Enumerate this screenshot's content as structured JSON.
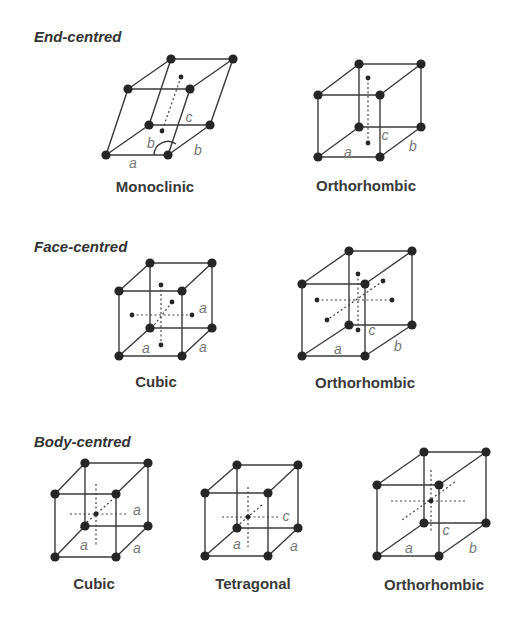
{
  "sections": [
    {
      "label": "End-centred",
      "x": 34,
      "y": 42
    },
    {
      "label": "Face-centred",
      "x": 34,
      "y": 252
    },
    {
      "label": "Body-centred",
      "x": 34,
      "y": 447
    }
  ],
  "lattices": [
    {
      "id": "end-monoclinic",
      "name": "Monoclinic",
      "title_x": 155,
      "title_y": 192,
      "v": {
        "btl": [
          171,
          59
        ],
        "btr": [
          233,
          59
        ],
        "ftl": [
          128,
          89
        ],
        "ftr": [
          190,
          89
        ],
        "bbl": [
          149,
          125
        ],
        "bbr": [
          210,
          125
        ],
        "fbl": [
          106,
          155
        ],
        "fbr": [
          168,
          155
        ]
      },
      "dots": [
        [
          181,
          77
        ],
        [
          162,
          131
        ]
      ],
      "dashes": [
        [
          [
            181,
            77
          ],
          [
            162,
            131
          ]
        ]
      ],
      "labels": [
        {
          "t": "c",
          "x": 189,
          "y": 122
        },
        {
          "t": "b",
          "x": 151,
          "y": 148
        },
        {
          "t": "b",
          "x": 198,
          "y": 155
        },
        {
          "t": "a",
          "x": 133,
          "y": 168
        }
      ],
      "arc": true
    },
    {
      "id": "end-orthorhombic",
      "name": "Orthorhombic",
      "title_x": 366,
      "title_y": 191,
      "v": {
        "btl": [
          359,
          64
        ],
        "btr": [
          421,
          64
        ],
        "ftl": [
          318,
          95
        ],
        "ftr": [
          380,
          95
        ],
        "bbl": [
          359,
          127
        ],
        "bbr": [
          421,
          127
        ],
        "fbl": [
          318,
          157
        ],
        "fbr": [
          380,
          157
        ]
      },
      "dots": [
        [
          368,
          78
        ],
        [
          368,
          143
        ]
      ],
      "dashes": [
        [
          [
            368,
            78
          ],
          [
            368,
            143
          ]
        ]
      ],
      "labels": [
        {
          "t": "c",
          "x": 385,
          "y": 140
        },
        {
          "t": "a",
          "x": 348,
          "y": 157
        },
        {
          "t": "b",
          "x": 413,
          "y": 151
        }
      ]
    },
    {
      "id": "face-cubic",
      "name": "Cubic",
      "title_x": 156,
      "title_y": 387,
      "v": {
        "btl": [
          150,
          263
        ],
        "btr": [
          212,
          263
        ],
        "ftl": [
          119,
          291
        ],
        "ftr": [
          182,
          291
        ],
        "bbl": [
          150,
          328
        ],
        "bbr": [
          212,
          328
        ],
        "fbl": [
          119,
          356
        ],
        "fbr": [
          182,
          356
        ]
      },
      "dots": [
        [
          161,
          285
        ],
        [
          172,
          302
        ],
        [
          132,
          315
        ],
        [
          192,
          315
        ],
        [
          161,
          345
        ]
      ],
      "dashes": [
        [
          [
            161,
            285
          ],
          [
            161,
            345
          ]
        ],
        [
          [
            132,
            315
          ],
          [
            192,
            315
          ]
        ],
        [
          [
            172,
            302
          ],
          [
            152,
            328
          ]
        ]
      ],
      "labels": [
        {
          "t": "a",
          "x": 203,
          "y": 313
        },
        {
          "t": "a",
          "x": 146,
          "y": 353
        },
        {
          "t": "a",
          "x": 203,
          "y": 352
        }
      ]
    },
    {
      "id": "face-orthorhombic",
      "name": "Orthorhombic",
      "title_x": 365,
      "title_y": 388,
      "v": {
        "btl": [
          349,
          251
        ],
        "btr": [
          412,
          251
        ],
        "ftl": [
          302,
          284
        ],
        "ftr": [
          365,
          284
        ],
        "bbl": [
          349,
          325
        ],
        "bbr": [
          412,
          325
        ],
        "fbl": [
          302,
          356
        ],
        "fbr": [
          365,
          356
        ]
      },
      "dots": [
        [
          358,
          274
        ],
        [
          383,
          281
        ],
        [
          317,
          300
        ],
        [
          392,
          300
        ],
        [
          327,
          320
        ],
        [
          358,
          330
        ]
      ],
      "dashes": [
        [
          [
            358,
            274
          ],
          [
            358,
            330
          ]
        ],
        [
          [
            317,
            300
          ],
          [
            392,
            300
          ]
        ],
        [
          [
            383,
            281
          ],
          [
            327,
            320
          ]
        ]
      ],
      "labels": [
        {
          "t": "c",
          "x": 372,
          "y": 335
        },
        {
          "t": "a",
          "x": 338,
          "y": 354
        },
        {
          "t": "b",
          "x": 398,
          "y": 351
        }
      ]
    },
    {
      "id": "body-cubic",
      "name": "Cubic",
      "title_x": 94,
      "title_y": 589,
      "v": {
        "btl": [
          85,
          463
        ],
        "btr": [
          148,
          463
        ],
        "ftl": [
          55,
          494
        ],
        "ftr": [
          116,
          494
        ],
        "bbl": [
          85,
          526
        ],
        "bbr": [
          148,
          526
        ],
        "fbl": [
          55,
          557
        ],
        "fbr": [
          116,
          557
        ]
      },
      "dots": [
        [
          96,
          514
        ]
      ],
      "dashes": [
        [
          [
            96,
            484
          ],
          [
            96,
            545
          ]
        ],
        [
          [
            70,
            514
          ],
          [
            126,
            514
          ]
        ],
        [
          [
            112,
            500
          ],
          [
            78,
            530
          ]
        ]
      ],
      "labels": [
        {
          "t": "a",
          "x": 137,
          "y": 515
        },
        {
          "t": "a",
          "x": 84,
          "y": 550
        },
        {
          "t": "a",
          "x": 137,
          "y": 553
        }
      ]
    },
    {
      "id": "body-tetragonal",
      "name": "Tetragonal",
      "title_x": 253,
      "title_y": 589,
      "v": {
        "btl": [
          237,
          465
        ],
        "btr": [
          298,
          465
        ],
        "ftl": [
          205,
          493
        ],
        "ftr": [
          268,
          493
        ],
        "bbl": [
          237,
          528
        ],
        "bbr": [
          298,
          528
        ],
        "fbl": [
          205,
          556
        ],
        "fbr": [
          268,
          556
        ]
      },
      "dots": [
        [
          248,
          517
        ]
      ],
      "dashes": [
        [
          [
            248,
            487
          ],
          [
            248,
            547
          ]
        ],
        [
          [
            222,
            517
          ],
          [
            278,
            517
          ]
        ],
        [
          [
            262,
            505
          ],
          [
            236,
            527
          ]
        ]
      ],
      "labels": [
        {
          "t": "c",
          "x": 286,
          "y": 521
        },
        {
          "t": "a",
          "x": 237,
          "y": 549
        },
        {
          "t": "a",
          "x": 294,
          "y": 551
        }
      ]
    },
    {
      "id": "body-orthorhombic",
      "name": "Orthorhombic",
      "title_x": 434,
      "title_y": 590,
      "v": {
        "btl": [
          424,
          452
        ],
        "btr": [
          486,
          452
        ],
        "ftl": [
          377,
          485
        ],
        "ftr": [
          439,
          485
        ],
        "bbl": [
          424,
          523
        ],
        "bbr": [
          486,
          523
        ],
        "fbl": [
          377,
          556
        ],
        "fbr": [
          439,
          556
        ]
      },
      "dots": [
        [
          431,
          501
        ]
      ],
      "dashes": [
        [
          [
            431,
            470
          ],
          [
            431,
            531
          ]
        ],
        [
          [
            391,
            501
          ],
          [
            465,
            501
          ]
        ],
        [
          [
            455,
            482
          ],
          [
            402,
            520
          ]
        ]
      ],
      "labels": [
        {
          "t": "c",
          "x": 446,
          "y": 535
        },
        {
          "t": "a",
          "x": 409,
          "y": 553
        },
        {
          "t": "b",
          "x": 473,
          "y": 553
        }
      ]
    }
  ]
}
